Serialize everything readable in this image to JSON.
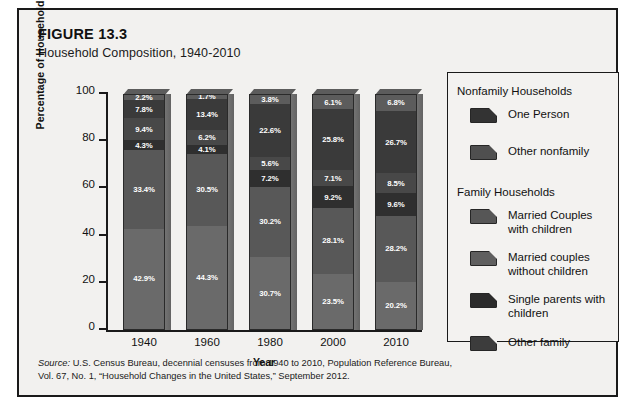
{
  "figure": {
    "number": "FIGURE 13.3",
    "title": "Household Composition, 1940-2010"
  },
  "source": {
    "lead": "Source:",
    "text": " U.S. Census Bureau, decennial censuses from 1940 to 2010, Population Reference Bureau, Vol. 67, No. 1, “Household Changes in the United States,” September 2012."
  },
  "legend": {
    "group_nonfamily": "Nonfamily Households",
    "group_family": "Family Households",
    "items": [
      {
        "label": "One Person",
        "color": "#333333",
        "group": "nonfamily"
      },
      {
        "label": "Other nonfamily",
        "color": "#4f4f4f",
        "group": "nonfamily"
      },
      {
        "label": "Married Couples with children",
        "line1": "Married Couples",
        "line2": "with children",
        "color": "#565656",
        "group": "family"
      },
      {
        "label": "Married couples without children",
        "line1": "Married couples",
        "line2": "without children",
        "color": "#5f5f5f",
        "group": "family"
      },
      {
        "label": "Single parents with children",
        "line1": "Single parents with",
        "line2": "children",
        "color": "#2b2b2b",
        "group": "family"
      },
      {
        "label": "Other family",
        "line1": "Other family",
        "line2": "",
        "color": "#3c3c3c",
        "group": "family"
      }
    ]
  },
  "chart_data": {
    "type": "bar",
    "subtype": "stacked-100-percent",
    "title": "Household Composition, 1940-2010",
    "xlabel": "Year",
    "ylabel": "Percentage of Households",
    "ylim": [
      0,
      100
    ],
    "yticks": [
      "0",
      "20",
      "40",
      "60",
      "80",
      "100"
    ],
    "grid": false,
    "legend_position": "right",
    "categories": [
      "1940",
      "1960",
      "1980",
      "2000",
      "2010"
    ],
    "stack_order_bottom_to_top": [
      "Married Couples with children",
      "Married couples without children",
      "Single parents with children",
      "Other family",
      "One Person",
      "Other nonfamily"
    ],
    "series": [
      {
        "name": "Married Couples with children",
        "color": "#6a6a6a",
        "values": [
          42.9,
          44.3,
          30.7,
          23.5,
          20.2
        ],
        "labels": [
          "42.9%",
          "44.3%",
          "30.7%",
          "23.5%",
          "20.2%"
        ]
      },
      {
        "name": "Married couples without children",
        "color": "#585858",
        "values": [
          33.4,
          30.5,
          30.2,
          28.1,
          28.2
        ],
        "labels": [
          "33.4%",
          "30.5%",
          "30.2%",
          "28.1%",
          "28.2%"
        ]
      },
      {
        "name": "Single parents with children",
        "color": "#2f2f2f",
        "values": [
          4.3,
          4.1,
          7.2,
          9.2,
          9.6
        ],
        "labels": [
          "4.3%",
          "4.1%",
          "7.2%",
          "9.2%",
          "9.6%"
        ]
      },
      {
        "name": "Other family",
        "color": "#484848",
        "values": [
          9.4,
          6.2,
          5.6,
          7.1,
          8.5
        ],
        "labels": [
          "9.4%",
          "6.2%",
          "5.6%",
          "7.1%",
          "8.5%"
        ]
      },
      {
        "name": "One Person",
        "color": "#3a3a3a",
        "values": [
          7.8,
          13.4,
          22.6,
          25.8,
          26.7
        ],
        "labels": [
          "7.8%",
          "13.4%",
          "22.6%",
          "25.8%",
          "26.7%"
        ]
      },
      {
        "name": "Other nonfamily",
        "color": "#5c5c5c",
        "values": [
          2.2,
          1.7,
          3.8,
          6.1,
          6.8
        ],
        "labels": [
          "2.2%",
          "1.7%",
          "3.8%",
          "6.1%",
          "6.8%"
        ]
      }
    ]
  }
}
